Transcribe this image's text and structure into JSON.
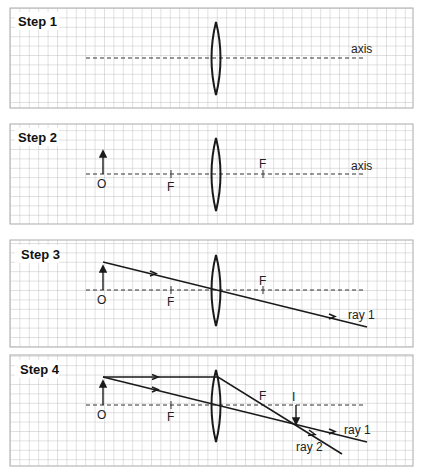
{
  "figure": {
    "grid_cell_px": 9.4,
    "colors": {
      "grid": "#b8b8b8",
      "ink": "#1a1a1a",
      "background": "#ffffff"
    }
  },
  "panels": [
    {
      "step_label": "Step 1",
      "axis_label": "axis",
      "elements": [
        "grid",
        "dashed principal axis",
        "converging lens"
      ]
    },
    {
      "step_label": "Step 2",
      "axis_label": "axis",
      "object_label": "O",
      "focal_left_label": "F",
      "focal_right_label": "F",
      "elements": [
        "object arrow O",
        "focal points F (both sides)",
        "lens",
        "axis"
      ]
    },
    {
      "step_label": "Step 3",
      "object_label": "O",
      "focal_left_label": "F",
      "focal_right_label": "F",
      "ray_label": "ray 1",
      "elements": [
        "ray 1 through optical centre, undeviated"
      ]
    },
    {
      "step_label": "Step 4",
      "object_label": "O",
      "focal_left_label": "F",
      "focal_right_label": "F",
      "image_label": "I",
      "ray1_label": "ray 1",
      "ray2_label": "ray 2",
      "elements": [
        "ray 1 through centre",
        "ray 2 parallel then through F",
        "inverted real image I at intersection"
      ]
    }
  ]
}
